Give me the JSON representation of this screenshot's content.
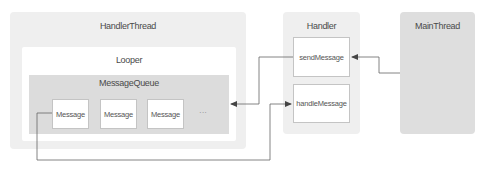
{
  "diagram": {
    "handler_thread": {
      "label": "HandlerThread",
      "looper": {
        "label": "Looper",
        "message_queue": {
          "label": "MessageQueue",
          "messages": [
            "Message",
            "Message",
            "Message"
          ],
          "ellipsis": "···"
        }
      }
    },
    "handler": {
      "label": "Handler",
      "methods": [
        "sendMessage",
        "handleMessage"
      ]
    },
    "main_thread": {
      "label": "MainThread"
    },
    "connections": [
      {
        "from": "MainThread",
        "to": "sendMessage",
        "type": "arrow"
      },
      {
        "from": "sendMessage",
        "to": "MessageQueue",
        "type": "arrow"
      },
      {
        "from": "Message",
        "to": "handleMessage",
        "type": "arrow"
      }
    ],
    "colors": {
      "thread_bg": "#efefef",
      "queue_bg": "#dcdcdc",
      "main_bg": "#dedede",
      "line": "#555555"
    }
  }
}
